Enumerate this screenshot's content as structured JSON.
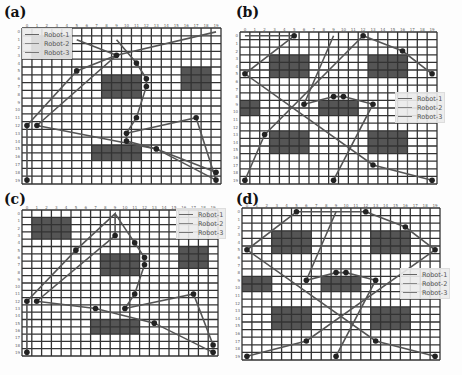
{
  "figure": {
    "colors": {
      "grid": "#333333",
      "cell": "#ffffff",
      "obstacle": "#555555",
      "path": "#555555",
      "node": "#222222",
      "robot1": "#666666",
      "robot2": "#888888",
      "robot3": "#777777"
    },
    "panels": [
      {
        "label": "(a)",
        "legend": [
          "Robot-1",
          "Robot-2",
          "Robot-3"
        ],
        "x_ticks": [
          "0",
          "1",
          "2",
          "3",
          "4",
          "5",
          "6",
          "7",
          "8",
          "9",
          "10",
          "11",
          "12",
          "13",
          "14",
          "15",
          "16",
          "17",
          "18",
          "19"
        ],
        "y_ticks": [
          "0",
          "1",
          "2",
          "3",
          "4",
          "5",
          "6",
          "7",
          "8",
          "9",
          "10",
          "11",
          "12",
          "13",
          "14",
          "15",
          "16",
          "17",
          "18",
          "19"
        ],
        "obstacles": [
          [
            1,
            1,
            4,
            3
          ],
          [
            8,
            6,
            4,
            3
          ],
          [
            16,
            5,
            3,
            3
          ],
          [
            7,
            15,
            5,
            2
          ]
        ],
        "paths": [
          [
            [
              0,
              12
            ],
            [
              5,
              5
            ],
            [
              9,
              3
            ],
            [
              19,
              0
            ]
          ],
          [
            [
              1,
              12
            ],
            [
              9,
              3
            ],
            [
              5,
              1
            ]
          ],
          [
            [
              9,
              1
            ],
            [
              11,
              4
            ],
            [
              12,
              6
            ],
            [
              12,
              7
            ],
            [
              11,
              11
            ],
            [
              10,
              13
            ],
            [
              10,
              14
            ],
            [
              13,
              15
            ],
            [
              19,
              19
            ]
          ],
          [
            [
              1,
              12
            ],
            [
              13,
              15
            ],
            [
              19,
              18
            ]
          ],
          [
            [
              10,
              13
            ],
            [
              17,
              11
            ],
            [
              19,
              19
            ]
          ],
          [
            [
              0,
              19
            ],
            [
              0,
              12
            ]
          ]
        ],
        "nodes": [
          [
            9,
            3
          ],
          [
            5,
            5
          ],
          [
            11,
            4
          ],
          [
            12,
            6
          ],
          [
            12,
            7
          ],
          [
            11,
            11
          ],
          [
            10,
            13
          ],
          [
            10,
            14
          ],
          [
            13,
            15
          ],
          [
            17,
            11
          ],
          [
            0,
            12
          ],
          [
            1,
            12
          ],
          [
            19,
            18
          ],
          [
            19,
            19
          ],
          [
            0,
            19
          ]
        ]
      },
      {
        "label": "(b)",
        "legend": [
          "Robot-1",
          "Robot-2",
          "Robot-3"
        ],
        "x_ticks": [
          "0",
          "1",
          "2",
          "3",
          "4",
          "5",
          "6",
          "7",
          "8",
          "9",
          "10",
          "11",
          "12",
          "13",
          "14",
          "15",
          "16",
          "17",
          "18",
          "19"
        ],
        "y_ticks": [
          "0",
          "1",
          "2",
          "3",
          "4",
          "5",
          "6",
          "7",
          "8",
          "9",
          "10",
          "11",
          "12",
          "13",
          "14",
          "15",
          "16",
          "17",
          "18",
          "19"
        ],
        "obstacles": [
          [
            3,
            3,
            4,
            3
          ],
          [
            13,
            3,
            4,
            3
          ],
          [
            0,
            9,
            2,
            2
          ],
          [
            8,
            9,
            4,
            2
          ],
          [
            3,
            13,
            4,
            3
          ],
          [
            13,
            13,
            4,
            3
          ]
        ],
        "paths": [
          [
            [
              0,
              0
            ],
            [
              5,
              0
            ],
            [
              0,
              5
            ],
            [
              13,
              17
            ],
            [
              19,
              19
            ]
          ],
          [
            [
              12,
              0
            ],
            [
              16,
              2
            ],
            [
              19,
              5
            ]
          ],
          [
            [
              0,
              19
            ],
            [
              2,
              13
            ],
            [
              12,
              0
            ]
          ],
          [
            [
              9,
              0
            ],
            [
              6,
              9
            ],
            [
              9,
              8
            ],
            [
              10,
              8
            ],
            [
              13,
              9
            ],
            [
              9,
              19
            ]
          ]
        ],
        "nodes": [
          [
            5,
            0
          ],
          [
            12,
            0
          ],
          [
            16,
            2
          ],
          [
            0,
            5
          ],
          [
            19,
            5
          ],
          [
            9,
            8
          ],
          [
            10,
            8
          ],
          [
            6,
            9
          ],
          [
            13,
            9
          ],
          [
            2,
            13
          ],
          [
            13,
            17
          ],
          [
            0,
            19
          ],
          [
            9,
            19
          ],
          [
            19,
            19
          ]
        ]
      },
      {
        "label": "(c)",
        "legend": [
          "Robot-1",
          "Robot-2",
          "Robot-3"
        ],
        "x_ticks": [
          "0",
          "1",
          "2",
          "3",
          "4",
          "5",
          "6",
          "7",
          "8",
          "9",
          "10",
          "11",
          "12",
          "13",
          "14",
          "15",
          "16",
          "17",
          "18",
          "19"
        ],
        "y_ticks": [
          "0",
          "1",
          "2",
          "3",
          "4",
          "5",
          "6",
          "7",
          "8",
          "9",
          "10",
          "11",
          "12",
          "13",
          "14",
          "15",
          "16",
          "17",
          "18",
          "19"
        ],
        "obstacles": [
          [
            1,
            1,
            4,
            3
          ],
          [
            8,
            6,
            4,
            3
          ],
          [
            16,
            5,
            3,
            3
          ],
          [
            7,
            15,
            5,
            2
          ]
        ],
        "paths": [
          [
            [
              0,
              12
            ],
            [
              5,
              5
            ],
            [
              9,
              0
            ],
            [
              9,
              3
            ]
          ],
          [
            [
              1,
              12
            ],
            [
              9,
              3
            ]
          ],
          [
            [
              9,
              0
            ],
            [
              11,
              4
            ],
            [
              12,
              6
            ],
            [
              12,
              7
            ],
            [
              11,
              11
            ],
            [
              10,
              13
            ]
          ],
          [
            [
              1,
              12
            ],
            [
              7,
              13
            ],
            [
              13,
              15
            ],
            [
              19,
              19
            ]
          ],
          [
            [
              10,
              13
            ],
            [
              17,
              11
            ],
            [
              19,
              18
            ]
          ],
          [
            [
              0,
              19
            ],
            [
              0,
              12
            ]
          ]
        ],
        "nodes": [
          [
            9,
            3
          ],
          [
            5,
            5
          ],
          [
            11,
            4
          ],
          [
            12,
            6
          ],
          [
            12,
            7
          ],
          [
            11,
            11
          ],
          [
            10,
            13
          ],
          [
            7,
            13
          ],
          [
            13,
            15
          ],
          [
            17,
            11
          ],
          [
            0,
            12
          ],
          [
            1,
            12
          ],
          [
            19,
            18
          ],
          [
            19,
            19
          ],
          [
            0,
            19
          ]
        ]
      },
      {
        "label": "(d)",
        "legend": [
          "Robot-1",
          "Robot-2",
          "Robot-3"
        ],
        "x_ticks": [
          "0",
          "1",
          "2",
          "3",
          "4",
          "5",
          "6",
          "7",
          "8",
          "9",
          "10",
          "11",
          "12",
          "13",
          "14",
          "15",
          "16",
          "17",
          "18",
          "19"
        ],
        "y_ticks": [
          "0",
          "1",
          "2",
          "3",
          "4",
          "5",
          "6",
          "7",
          "8",
          "9",
          "10",
          "11",
          "12",
          "13",
          "14",
          "15",
          "16",
          "17",
          "18",
          "19"
        ],
        "obstacles": [
          [
            3,
            3,
            4,
            3
          ],
          [
            13,
            3,
            4,
            3
          ],
          [
            0,
            9,
            3,
            2
          ],
          [
            8,
            9,
            4,
            2
          ],
          [
            3,
            13,
            4,
            3
          ],
          [
            13,
            13,
            4,
            3
          ]
        ],
        "paths": [
          [
            [
              5,
              0
            ],
            [
              12,
              0
            ]
          ],
          [
            [
              5,
              0
            ],
            [
              0,
              5
            ],
            [
              13,
              17
            ],
            [
              19,
              19
            ]
          ],
          [
            [
              12,
              0
            ],
            [
              16,
              2
            ],
            [
              19,
              5
            ]
          ],
          [
            [
              0,
              19
            ],
            [
              6,
              17
            ],
            [
              19,
              5
            ]
          ],
          [
            [
              9,
              0
            ],
            [
              6,
              9
            ],
            [
              9,
              8
            ],
            [
              10,
              8
            ],
            [
              13,
              9
            ],
            [
              9,
              19
            ]
          ]
        ],
        "nodes": [
          [
            5,
            0
          ],
          [
            12,
            0
          ],
          [
            16,
            2
          ],
          [
            0,
            5
          ],
          [
            19,
            5
          ],
          [
            9,
            8
          ],
          [
            10,
            8
          ],
          [
            6,
            9
          ],
          [
            13,
            9
          ],
          [
            6,
            17
          ],
          [
            13,
            17
          ],
          [
            0,
            19
          ],
          [
            9,
            19
          ],
          [
            19,
            19
          ]
        ]
      }
    ]
  },
  "layout": {
    "panels": [
      {
        "label_xy": [
          4,
          4
        ],
        "grid": [
          22,
          28,
          199,
          156
        ],
        "legend": [
          22,
          28,
          "ul"
        ]
      },
      {
        "label_xy": [
          236,
          4
        ],
        "grid": [
          240,
          32,
          197,
          152
        ],
        "legend": [
          395,
          92,
          "r"
        ]
      },
      {
        "label_xy": [
          4,
          191
        ],
        "grid": [
          22,
          210,
          196,
          146
        ],
        "legend": [
          176,
          208,
          "r"
        ]
      },
      {
        "label_xy": [
          236,
          191
        ],
        "grid": [
          242,
          208,
          198,
          152
        ],
        "legend": [
          400,
          268,
          "r"
        ]
      }
    ]
  }
}
